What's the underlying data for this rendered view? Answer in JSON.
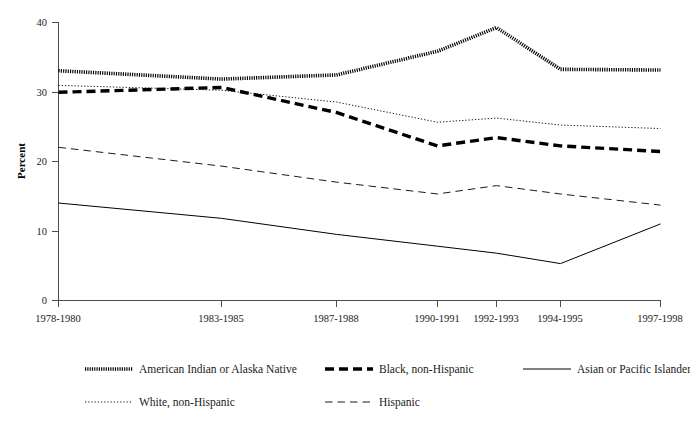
{
  "chart_data": {
    "type": "line",
    "title": "",
    "subtitle": "",
    "xlabel": "",
    "ylabel": "Percent",
    "ylim": [
      0,
      40
    ],
    "yticks": [
      0,
      10,
      20,
      30,
      40
    ],
    "ytick_labels": [
      "0",
      "10",
      "20",
      "30",
      "40"
    ],
    "grid": false,
    "legend_position": "bottom",
    "categories": [
      "1978-1980",
      "1983-1985",
      "1987-1988",
      "1990-1991",
      "1992-1993",
      "1994-1995",
      "1997-1998"
    ],
    "series": [
      {
        "name": "American Indian or Alaska Native",
        "style": "thick-dotted",
        "color": "#000000",
        "values": [
          33.0,
          31.8,
          32.4,
          35.8,
          39.2,
          33.2,
          33.1
        ]
      },
      {
        "name": "Black, non-Hispanic",
        "style": "thick-dashed",
        "color": "#000000",
        "values": [
          29.9,
          30.6,
          27.0,
          22.2,
          23.4,
          22.2,
          21.4
        ]
      },
      {
        "name": "Asian or Pacific Islander",
        "style": "solid",
        "color": "#000000",
        "values": [
          14.0,
          11.8,
          9.5,
          7.8,
          6.8,
          5.3,
          11.0
        ]
      },
      {
        "name": "White, non-Hispanic",
        "style": "fine-dotted",
        "color": "#000000",
        "values": [
          30.9,
          30.2,
          28.5,
          25.6,
          26.2,
          25.2,
          24.7
        ]
      },
      {
        "name": "Hispanic",
        "style": "long-dashed",
        "color": "#000000",
        "values": [
          22.0,
          19.3,
          17.0,
          15.3,
          16.5,
          15.3,
          13.7
        ]
      }
    ]
  },
  "axes": {
    "y_title": "Percent",
    "y_tick_0": "0",
    "y_tick_1": "10",
    "y_tick_2": "20",
    "y_tick_3": "30",
    "y_tick_4": "40",
    "x_tick_0": "1978-1980",
    "x_tick_1": "1983-1985",
    "x_tick_2": "1987-1988",
    "x_tick_3": "1990-1991",
    "x_tick_4": "1992-1993",
    "x_tick_5": "1994-1995",
    "x_tick_6": "1997-1998"
  },
  "legend": {
    "entries": [
      {
        "label": "American Indian or Alaska Native",
        "style": "thick-dotted"
      },
      {
        "label": "Black, non-Hispanic",
        "style": "thick-dashed"
      },
      {
        "label": "Asian or Pacific Islander",
        "style": "solid"
      },
      {
        "label": "White, non-Hispanic",
        "style": "fine-dotted"
      },
      {
        "label": "Hispanic",
        "style": "long-dashed"
      }
    ],
    "entry_0_label": "American Indian or Alaska Native",
    "entry_1_label": "Black, non-Hispanic",
    "entry_2_label": "Asian or Pacific Islander",
    "entry_3_label": "White, non-Hispanic",
    "entry_4_label": "Hispanic"
  }
}
